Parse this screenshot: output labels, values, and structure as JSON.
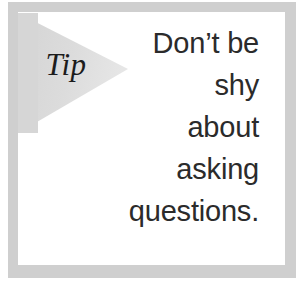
{
  "callout": {
    "kind": "tip",
    "banner": {
      "label": "Tip",
      "shape": "pennant-chevron-right",
      "fill_color": "#d9d9d9"
    },
    "frame": {
      "style": "dithered-halftone",
      "color": "#d2d2d2"
    },
    "body": {
      "align": "right",
      "text_color": "#2b2b2b",
      "lines": [
        "Don’t be",
        "shy",
        "about",
        "asking",
        "questions."
      ],
      "full_text": "Don’t be shy about asking questions."
    }
  }
}
